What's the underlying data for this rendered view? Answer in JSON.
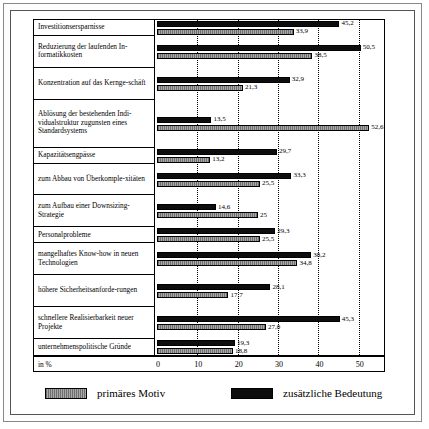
{
  "chart_data": {
    "type": "bar",
    "orientation": "horizontal",
    "title": "",
    "xlabel": "in %",
    "ylabel": "",
    "xlim": [
      0,
      55
    ],
    "xticks": [
      0,
      10,
      20,
      30,
      40,
      50
    ],
    "grid": true,
    "grid_style": "dotted vertical",
    "legend_position": "bottom",
    "axis_unit_label": "in %",
    "categories": [
      "Investitionsersparnisse",
      "Reduzierung der laufenden Informatikkosten",
      "Konzentration auf das Kerngeschäft",
      "Ablösung der bestehenden Individualstruktur zugunsten eines Standardsystems",
      "Kapazitätsengpässe",
      "zum Abbau von Überkomplexitäten",
      "zum Aufbau einer Downsizing-Strategie",
      "Personalprobleme",
      "mangelhaftes Know-how in neuen Technologien",
      "höhere Sicherheitsanforderungen",
      "schnellere Realisierbarkeit neuer Projekte",
      "unternehmenspolitische Gründe"
    ],
    "series": [
      {
        "name": "zusätzliche Bedeutung",
        "color": "#0d0d0d",
        "values": [
          45.2,
          50.5,
          32.9,
          13.5,
          29.7,
          33.3,
          14.6,
          29.3,
          38.2,
          28.1,
          45.3,
          19.3
        ]
      },
      {
        "name": "primäres Motiv",
        "color": "#8c8c8c",
        "values": [
          33.9,
          38.5,
          21.3,
          52.6,
          13.2,
          25.5,
          25,
          25.5,
          34.8,
          17.7,
          27.0,
          18.8
        ]
      }
    ]
  },
  "rows": [
    {
      "label": "Investitionsersparnisse",
      "lines": 1,
      "dark": "45,2",
      "light": "33,9"
    },
    {
      "label": "Reduzierung der laufenden In-\nformatikkosten",
      "lines": 2,
      "dark": "50,5",
      "light": "38,5"
    },
    {
      "label": "Konzentration auf das Kerngeschäft",
      "lines": 2,
      "dark": "32,9",
      "light": "21,3"
    },
    {
      "label": "Ablösung der bestehenden Individualstruktur zugunsten eines Standardsystems",
      "lines": 3,
      "dark": "13,5",
      "light": "52,6"
    },
    {
      "label": "Kapazitätsengpässe",
      "lines": 1,
      "dark": "29,7",
      "light": "13,2"
    },
    {
      "label": "zum Abbau von Überkomplexitäten",
      "lines": 2,
      "dark": "33,3",
      "light": "25,5"
    },
    {
      "label": "zum Aufbau einer Downsizing-Strategie",
      "lines": 2,
      "dark": "14,6",
      "light": "25"
    },
    {
      "label": "Personalprobleme",
      "lines": 1,
      "dark": "29,3",
      "light": "25,5"
    },
    {
      "label": "mangelhaftes Know-how in neuen Technologien",
      "lines": 2,
      "dark": "38,2",
      "light": "34,8"
    },
    {
      "label": "höhere Sicherheitsanforderungen",
      "lines": 2,
      "dark": "28,1",
      "light": "17,7"
    },
    {
      "label": "schnellere Realisierbarkeit neuer Projekte",
      "lines": 2,
      "dark": "45,3",
      "light": "27,0"
    },
    {
      "label": "unternehmenspolitische Gründe",
      "lines": 1,
      "dark": "19,3",
      "light": "18,8"
    }
  ],
  "labels_display": [
    "Investitionsersparnisse",
    "Reduzierung der laufenden In-­formatikkosten",
    "Konzentration auf das Kernge-­schäft",
    "Ablösung der bestehenden Indi-­vidualstruktur zugunsten eines Standardsystems",
    "Kapazitätsengpässe",
    "zum Abbau von Überkomple-­xitäten",
    "zum Aufbau einer Downsizing-­Strategie",
    "Personalprobleme",
    "mangelhaftes Know-how in neuen Technologien",
    "höhere Sicherheitsanforde-­rungen",
    "schnellere Realisierbarkeit neuer Projekte",
    "unternehmenspolitische Gründe"
  ],
  "axis": {
    "unit": "in %",
    "ticks": [
      "0",
      "10",
      "20",
      "30",
      "40",
      "50"
    ]
  },
  "legend": {
    "items": [
      {
        "label": "primäres Motiv",
        "swatch": "light"
      },
      {
        "label": "zusätzliche Bedeutung",
        "swatch": "dark"
      }
    ]
  },
  "colors": {
    "dark_series": "#0d0d0d",
    "light_series": "#8c8c8c",
    "frame": "#555555",
    "grid": "#000000",
    "background": "#ffffff"
  }
}
